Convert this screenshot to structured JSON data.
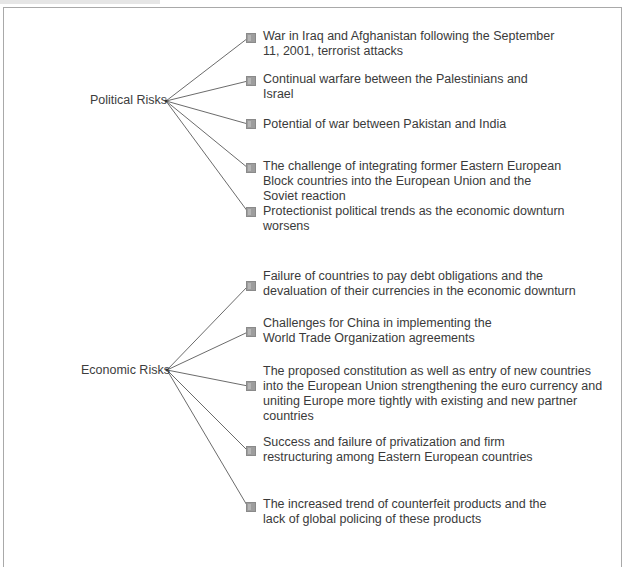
{
  "diagram": {
    "categories": [
      {
        "label": "Political Risks",
        "items": [
          "War in Iraq and Afghanistan following the September 11, 2001, terrorist attacks",
          "Continual warfare between the Palestinians and Israel",
          "Potential of war between Pakistan and India",
          "The challenge of integrating former Eastern European Block countries into the European Union and the Soviet reaction",
          "Protectionist political trends as the economic downturn worsens"
        ]
      },
      {
        "label": "Economic Risks",
        "items": [
          "Failure of countries to pay debt obligations and the devaluation of their currencies in the economic downturn",
          "Challenges for China in implementing the World Trade Organization agreements",
          "The proposed constitution as well as entry of new countries into the European Union strengthening the euro currency and uniting Europe more tightly with existing and new partner countries",
          "Success and failure of privatization and firm restructuring among Eastern European countries",
          "The increased trend of counterfeit products and the lack of global policing of these products"
        ]
      }
    ],
    "colors": {
      "line": "#555555",
      "bullet": "#9d9d9d",
      "frame": "#a9a9a9",
      "text": "#3a3a3a"
    }
  }
}
